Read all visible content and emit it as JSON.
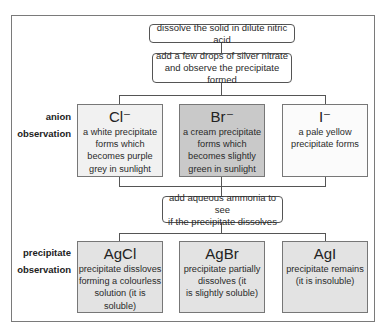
{
  "steps": {
    "step1": "dissolve the solid in dilute nitric acid",
    "step2": [
      "add a few drops of silver nitrate",
      "and observe the precipitate formed"
    ],
    "step3": [
      "add aqueous ammonia to see",
      "if the precipitate dissolves"
    ]
  },
  "row_labels": {
    "anion": [
      "anion",
      "observation"
    ],
    "precipitate": [
      "precipitate",
      "observation"
    ]
  },
  "anions": [
    {
      "symbol": "Cl⁻",
      "lines": [
        "a white precipitate",
        "forms which",
        "becomes purple",
        "grey in sunlight"
      ]
    },
    {
      "symbol": "Br⁻",
      "lines": [
        "a cream precipitate",
        "forms which",
        "becomes slightly",
        "green in sunlight"
      ]
    },
    {
      "symbol": "I⁻",
      "lines": [
        "a pale yellow",
        "precipitate forms"
      ]
    }
  ],
  "precipitates": [
    {
      "symbol": "AgCl",
      "lines": [
        "precipitate dissloves",
        "forming a colourless",
        "solution (it is soluble)"
      ]
    },
    {
      "symbol": "AgBr",
      "lines": [
        "precipitate partially",
        "dissolves (it",
        "is slightly soluble)"
      ]
    },
    {
      "symbol": "AgI",
      "lines": [
        "precipitate remains",
        "(it is insoluble)"
      ]
    }
  ],
  "colors": {
    "chloride_fill": "#f1f1f1",
    "bromide_fill": "#c9c9c9",
    "iodide_fill": "#fbfbfb",
    "precipitate_fill": "#e3e3e3"
  }
}
